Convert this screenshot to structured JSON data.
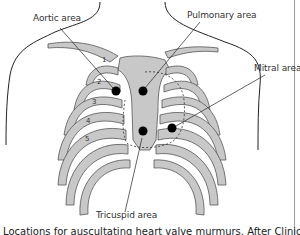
{
  "figure": {
    "labels": {
      "aortic": "Aortic area",
      "pulmonary": "Pulmonary area",
      "mitral": "Mitral area",
      "tricuspid": "Tricuspid area"
    },
    "rib_numbers": [
      "1",
      "2",
      "3",
      "4",
      "5"
    ],
    "caption": "Locations for auscultating heart valve murmurs. After Clinical Examination",
    "colors": {
      "bone": "#c8c8c8",
      "bone_outline": "#555555",
      "outline": "#222222",
      "marker": "#000000"
    }
  }
}
